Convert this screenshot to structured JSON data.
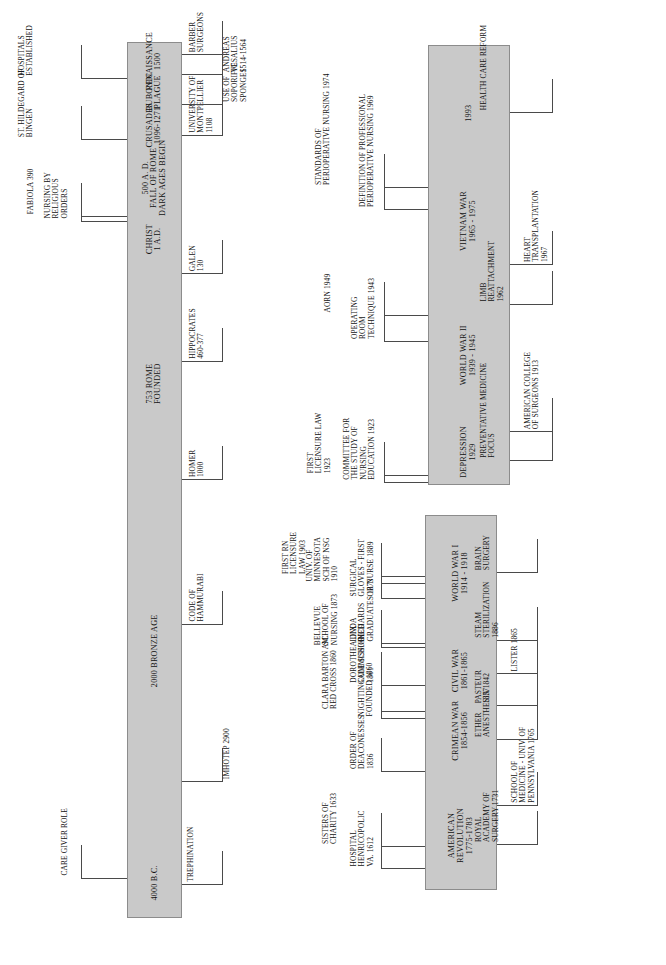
{
  "document": {
    "title": "History of Surgery and Perioperative Nursing Timeline",
    "type": "timeline",
    "orientation": "rotated-90-counterclockwise",
    "bar_color": "#c9c9c9",
    "line_color": "#4a4a4a",
    "page_color": "#ffffff"
  },
  "bands": [
    {
      "id": "band-ancient",
      "name": "Ancient through Renaissance",
      "era_segments": [
        {
          "label": "4000 B.C.",
          "pos": 0.04
        },
        {
          "label": "2000  BRONZE  AGE",
          "pos": 0.305
        },
        {
          "label": "753  ROME\nFOUNDED",
          "pos": 0.61
        },
        {
          "label": "CHRIST\n1 A.D.",
          "pos": 0.775
        },
        {
          "label": "500 A. D.\nFALL OF ROME\nDARK AGES BEGIN",
          "pos": 0.845
        },
        {
          "label": "CRUSADES\n1096-1271",
          "pos": 0.905
        },
        {
          "label": "BUBONIC\nPLAGUE",
          "pos": 0.943
        },
        {
          "label": "RENAISSANCE\n1500",
          "pos": 0.978
        }
      ],
      "above_events": [
        {
          "label": "CARE GIVER ROLE",
          "pos": 0.045
        },
        {
          "label": "FABIOLA   390",
          "pos": 0.8
        },
        {
          "label": "NURSING BY\nRELIGIOUS\nORDERS",
          "pos": 0.795
        },
        {
          "label": "ST. HILDEGARD OF\nBINGEN",
          "pos": 0.888
        },
        {
          "label": "HOSPITALS\nESTABLISHED",
          "pos": 0.958
        }
      ],
      "below_events": [
        {
          "label": "TREPHINATION",
          "pos": 0.038
        },
        {
          "label": "IMHOTEP 2900",
          "pos": 0.155
        },
        {
          "label": "CODE OF\nHAMMURABI",
          "pos": 0.335
        },
        {
          "label": "HOMER\n1000",
          "pos": 0.5
        },
        {
          "label": "HIPPOCRATES\n460-377",
          "pos": 0.635
        },
        {
          "label": "GALEN\n130",
          "pos": 0.735
        },
        {
          "label": "UNIVERSITY OF\nMONTPELLIER\n1108",
          "pos": 0.893
        },
        {
          "label": "USE OF\nSOPORIFIC\nSPONGES",
          "pos": 0.928
        },
        {
          "label": "ANDREAS\nVESALIUS\n1514-1564",
          "pos": 0.962
        },
        {
          "label": "BARBER\nSURGEONS",
          "pos": 0.985
        }
      ]
    },
    {
      "id": "band-modern",
      "name": "American Revolution through World War I",
      "era_segments": [
        {
          "label": "AMERICAN\nREVOLUTION\n1775-1783",
          "pos": 0.145
        },
        {
          "label": "CRIMEAN WAR\n1854-1856",
          "pos": 0.425
        },
        {
          "label": "CIVIL WAR\n1861-1865",
          "pos": 0.585
        },
        {
          "label": "WORLD WAR I\n1914 - 1918",
          "pos": 0.845
        }
      ],
      "above_events": [
        {
          "label": "HOSPITAL\nHENRICOPOLIC\nVA.  1612",
          "pos": 0.055
        },
        {
          "label": "SISTERS OF\nCHARITY 1633",
          "pos": 0.115
        },
        {
          "label": "ORDER OF\nDEACONESSES\n1836",
          "pos": 0.315
        },
        {
          "label": "NIGHTINGALE SCHOOL\nFOUNDED 1860",
          "pos": 0.455
        },
        {
          "label": "CLARA BARTON AM.\nRED CROSS 1860",
          "pos": 0.475
        },
        {
          "label": "DOROTHEA DIX\nCOMMISSIONED\n1861",
          "pos": 0.545
        },
        {
          "label": "LINDA\nRICHARDS\nGRADUATES 1873",
          "pos": 0.655
        },
        {
          "label": "BELLEVUE\nSCHOOL OF\nNURSING 1873",
          "pos": 0.645
        },
        {
          "label": "SURGICAL\nGLOVES - FIRST\nOR NURSE 1889",
          "pos": 0.775
        },
        {
          "label": "UNIV. OF\nMINNESOTA\nSCH OF  NSG\n1910",
          "pos": 0.815
        },
        {
          "label": "FIRST RN\nLICENSURE\nLAW 1903",
          "pos": 0.835
        }
      ],
      "below_events": [
        {
          "label": "ROYAL\nACADEMY OF\nSURGERY 1731",
          "pos": 0.12
        },
        {
          "label": "SCHOOL OF\nMEDICINE - UNIV. OF\nPENNSYLVANIA 1765",
          "pos": 0.225
        },
        {
          "label": "ETHER\nANESTHESIA 1842",
          "pos": 0.4
        },
        {
          "label": "PASTEUR\n1857",
          "pos": 0.49
        },
        {
          "label": "LISTER 1865",
          "pos": 0.575
        },
        {
          "label": "STEAM\nSTERILIZATION\n1886",
          "pos": 0.665
        },
        {
          "label": "BRAIN\nSURGERY",
          "pos": 0.845
        }
      ]
    },
    {
      "id": "band-contemporary",
      "name": "Depression through 1993",
      "era_segments": [
        {
          "label": "DEPRESSION\n1929",
          "pos": 0.075
        },
        {
          "label": "WORLD WAR II\n1939 - 1945",
          "pos": 0.295
        },
        {
          "label": "VIETNAM WAR\n1965 - 1975",
          "pos": 0.6
        },
        {
          "label": "1993",
          "pos": 0.845
        }
      ],
      "above_events": [
        {
          "label": "COMMITTEE FOR\nTHE STUDY OF\nNURSING\nEDUCATION 1923",
          "pos": 0.005
        },
        {
          "label": "FIRST\nLICENSURE LAW\n1923",
          "pos": 0.02
        },
        {
          "label": "OPERATING\nROOM\nTECHNIQUE 1943",
          "pos": 0.325
        },
        {
          "label": "AORN 1949",
          "pos": 0.385
        },
        {
          "label": "DEFINITION OF PROFESSIONAL\nPERIOPERATIVE NURSING 1969",
          "pos": 0.625
        },
        {
          "label": "STANDARDS OF\nPERIOPERATIVE NURSING 1974",
          "pos": 0.675
        }
      ],
      "below_events": [
        {
          "label": "PREVENTATIVE MEDICINE\nFOCUS",
          "pos": 0.055
        },
        {
          "label": "AMERICAN COLLEGE\nOF SURGEONS 1913",
          "pos": 0.12
        },
        {
          "label": "LIMB\nREATTACHMENT\n1962",
          "pos": 0.41
        },
        {
          "label": "HEART\nTRANSPLANTATION\n1967",
          "pos": 0.5
        },
        {
          "label": "HEALTH CARE REFORM",
          "pos": 0.845
        }
      ]
    }
  ]
}
